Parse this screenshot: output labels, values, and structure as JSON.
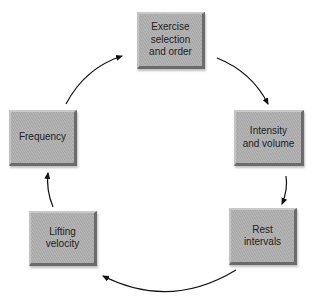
{
  "diagram": {
    "type": "cycle",
    "nodes": [
      {
        "id": "exercise",
        "label": "Exercise\nselection\nand order"
      },
      {
        "id": "intensity",
        "label": "Intensity\nand volume"
      },
      {
        "id": "rest",
        "label": "Rest\nintervals"
      },
      {
        "id": "velocity",
        "label": "Lifting\nvelocity"
      },
      {
        "id": "frequency",
        "label": "Frequency"
      }
    ],
    "edges": [
      {
        "from": "exercise",
        "to": "intensity"
      },
      {
        "from": "intensity",
        "to": "rest"
      },
      {
        "from": "rest",
        "to": "velocity"
      },
      {
        "from": "velocity",
        "to": "frequency"
      },
      {
        "from": "frequency",
        "to": "exercise"
      }
    ],
    "colors": {
      "box_fill": "#afafaf",
      "box_shadow": "#6b6b6b",
      "arrow": "#111111",
      "text": "#222222"
    }
  }
}
